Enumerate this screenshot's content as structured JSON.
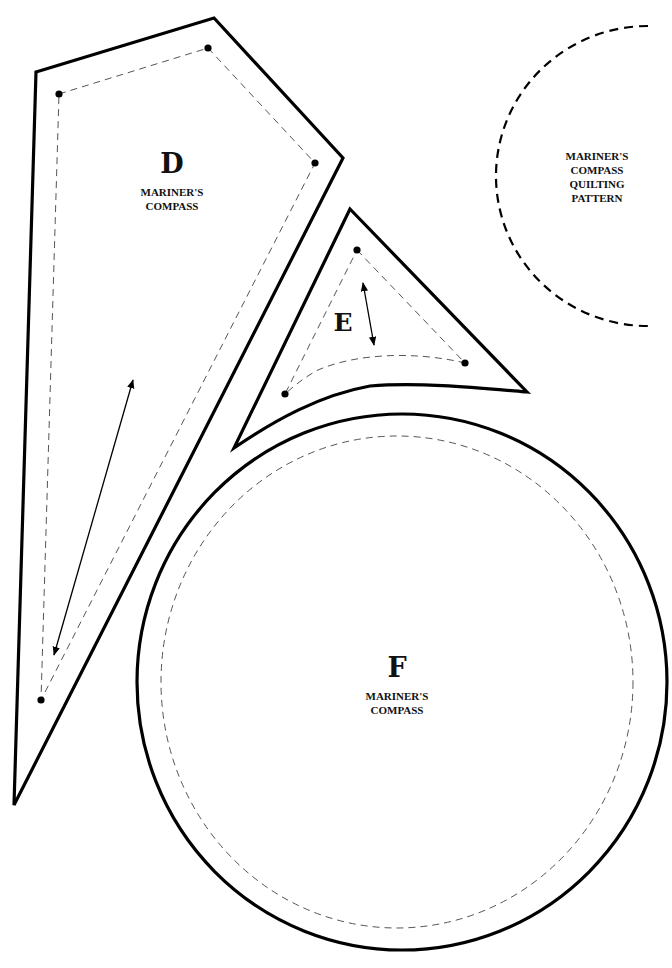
{
  "page": {
    "background": "#ffffff",
    "line_color": "#000000"
  },
  "pieces": {
    "D": {
      "letter": "D",
      "line1": "MARINER'S",
      "line2": "COMPASS",
      "outline_points": "36,72 214,18 343,158 14,805",
      "sewing_points": "59,94 208,48 315,163 41,700",
      "grainline": {
        "x1": 133,
        "y1": 380,
        "x2": 54,
        "y2": 655
      }
    },
    "E": {
      "letter": "E",
      "grainline": {
        "x1": 363,
        "y1": 283,
        "x2": 374,
        "y2": 345
      }
    },
    "F": {
      "letter": "F",
      "line1": "MARINER'S",
      "line2": "COMPASS"
    }
  },
  "quilting_pattern": {
    "line1": "MARINER'S",
    "line2": "COMPASS",
    "line3": "QUILTING",
    "line4": "PATTERN"
  },
  "icons": {
    "grainline_arrow": "double-headed-arrow",
    "corner_marker": "filled-dot"
  }
}
